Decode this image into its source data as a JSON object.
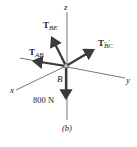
{
  "diagram": {
    "type": "free-body-diagram",
    "caption": "(b)",
    "point_label": "B",
    "axes": {
      "x": "x",
      "y": "y",
      "z": "z"
    },
    "forces": [
      {
        "id": "T_BE",
        "main": "T",
        "sub": "BE"
      },
      {
        "id": "T_AB",
        "main": "T",
        "sub": "AB"
      },
      {
        "id": "T_BC",
        "main": "T",
        "sub": "BC"
      },
      {
        "id": "W",
        "label": "800 N"
      }
    ],
    "colors": {
      "arrow": "#3a3a3a",
      "axis": "#555555",
      "text": "#222222"
    }
  }
}
